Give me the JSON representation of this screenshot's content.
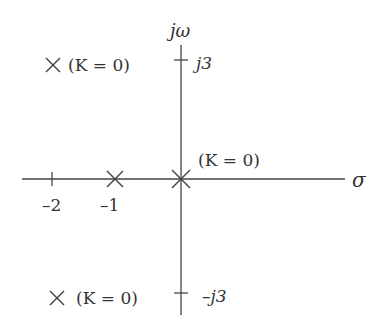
{
  "axes": {
    "imag_label": "jω",
    "real_label": "σ"
  },
  "ticks": {
    "real": [
      {
        "value": -2,
        "label": "–2"
      },
      {
        "value": -1,
        "label": "–1"
      }
    ],
    "imag": [
      {
        "value": 3,
        "label": "j3"
      },
      {
        "value": -3,
        "label": "–j3"
      }
    ]
  },
  "poles": [
    {
      "location": "-1+0j",
      "label": ""
    },
    {
      "location": "0+0j",
      "label": "(K = 0)"
    },
    {
      "location": "-2.0+j3",
      "label": "(K = 0)"
    },
    {
      "location": "-2.0-j3",
      "label": "(K = 0)"
    }
  ],
  "labels": {
    "upper_pole": "(K = 0)",
    "origin_pole": "(K = 0)",
    "lower_pole": "(K = 0)",
    "tick_neg2": "–2",
    "tick_neg1": "–1",
    "tick_j3": "j3",
    "tick_negj3": "–j3",
    "jw": "jω",
    "sigma": "σ"
  },
  "colors": {
    "stroke": "#333333",
    "background": "#ffffff"
  }
}
